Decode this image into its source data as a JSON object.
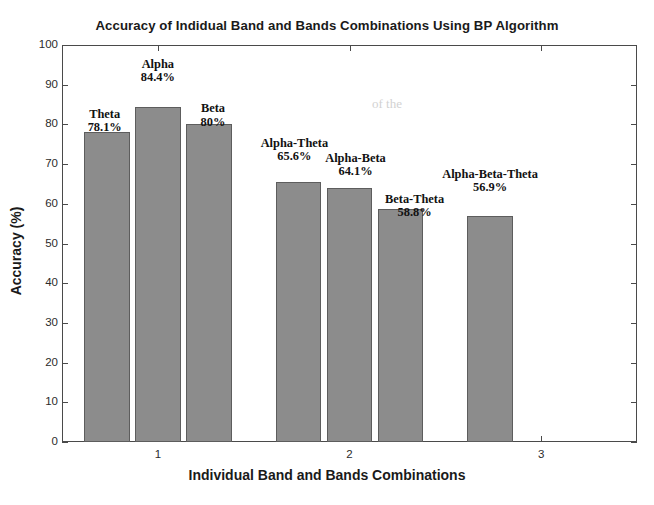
{
  "chart_data": {
    "type": "bar",
    "title": "Accuracy of Indidual Band and Bands Combinations Using BP Algorithm",
    "xlabel": "Individual Band and Bands Combinations",
    "ylabel": "Accuracy (%)",
    "ylim": [
      0,
      100
    ],
    "xlim": [
      0.5,
      3.5
    ],
    "ytick_labels": [
      "100",
      "90",
      "80",
      "70",
      "60",
      "50",
      "40",
      "30",
      "20",
      "10",
      "0"
    ],
    "ytick_values": [
      100,
      90,
      80,
      70,
      60,
      50,
      40,
      30,
      20,
      10,
      0
    ],
    "xtick_labels": [
      "1",
      "2",
      "3"
    ],
    "xtick_values": [
      1,
      2,
      3
    ],
    "grid": false,
    "legend": false,
    "bar_color": "#8c8c8c",
    "bar_edge_color": "#5d5d5d",
    "groups": [
      {
        "group_label": "1",
        "bars": [
          {
            "name": "Theta",
            "value": 78.1,
            "value_label": "78.1%"
          },
          {
            "name": "Alpha",
            "value": 84.4,
            "value_label": "84.4%"
          },
          {
            "name": "Beta",
            "value": 80,
            "value_label": "80%"
          }
        ]
      },
      {
        "group_label": "2",
        "bars": [
          {
            "name": "Alpha-Theta",
            "value": 65.6,
            "value_label": "65.6%"
          },
          {
            "name": "Alpha-Beta",
            "value": 64.1,
            "value_label": "64.1%"
          },
          {
            "name": "Beta-Theta",
            "value": 58.8,
            "value_label": "58.8%"
          }
        ]
      },
      {
        "group_label": "3",
        "bars": [
          {
            "name": "Alpha-Beta-Theta",
            "value": 56.9,
            "value_label": "56.9%"
          }
        ]
      }
    ],
    "categories": [
      "Theta",
      "Alpha",
      "Beta",
      "Alpha-Theta",
      "Alpha-Beta",
      "Beta-Theta",
      "Alpha-Beta-Theta"
    ],
    "values": [
      78.1,
      84.4,
      80,
      65.6,
      64.1,
      58.8,
      56.9
    ]
  }
}
